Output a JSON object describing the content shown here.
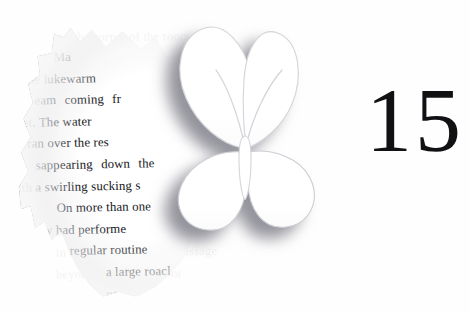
{
  "page": {
    "width": 470,
    "height": 312,
    "background_color": "#fefefe"
  },
  "chapter": {
    "number": "15",
    "color": "#111114"
  },
  "paper_scrap": {
    "shape": "torn-leaf-shaped-paper",
    "text_color": "#16161a",
    "lines": [
      "Ma      ck",
      "the lukewarm",
      "eam  coming  fr",
      "cet. The water",
      "d ran over the res",
      "sappearing   down   the",
      "ith a swirling sucking s",
      "On more than one",
      "thew had performe",
      "is regular routine",
      "a large roacl",
      "pe"
    ],
    "line_fragments": [
      {
        "text": "Ma",
        "indent": "i4"
      },
      {
        "text": "ck",
        "indent": "i6"
      },
      {
        "text": "the lukewarm",
        "indent": "i2"
      },
      {
        "text": "eam  coming  fr",
        "indent": "i3"
      },
      {
        "text": "cet. The water",
        "indent": "i3"
      },
      {
        "text": "d ran over the res",
        "indent": "i3"
      },
      {
        "text": "sappearing   down   the",
        "indent": "i3"
      },
      {
        "text": "ith a swirling sucking s",
        "indent": "i3"
      },
      {
        "text": "On more than one",
        "indent": "i4"
      },
      {
        "text": "thew had performe",
        "indent": "i2"
      },
      {
        "text": "is regular routine",
        "indent": "i4"
      },
      {
        "text": "a large roacl",
        "indent": "i6"
      },
      {
        "text": "pe",
        "indent": "i6"
      }
    ]
  },
  "ghost_text": {
    "description": "faint bleed-through printing visible on the white page",
    "lines": [
      "ing the corner of the room and",
      "watched as the water ran clear",
      "before shutting the tap again and",
      "turning back toward the hallway",
      "where the light had been left on",
      "for most of the evening before",
      "anyone thought to notice it there",
      "among the quiet shapes of things",
      "that had been put away wrongly",
      "and left to gather dust quietly",
      "in the long and narrow passage",
      "beyond the kitchen door"
    ]
  },
  "butterfly": {
    "name": "butterfly-silhouette",
    "fill_color": "#ffffff",
    "outline_color": "#d8d8dd",
    "shadow_color": "#9a9aa2"
  }
}
